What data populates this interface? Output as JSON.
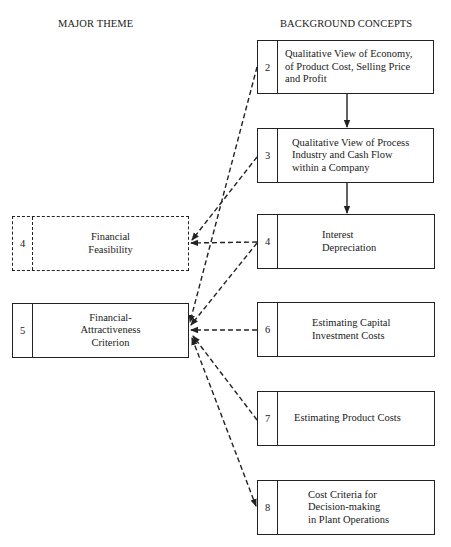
{
  "headers": {
    "left": "MAJOR THEME",
    "right": "BACKGROUND CONCEPTS"
  },
  "major_theme": [
    {
      "num": "4",
      "label": "Financial Feasibility",
      "lines": [
        "Financial",
        "Feasibility"
      ],
      "style": "dashed"
    },
    {
      "num": "5",
      "label": "Financial-Attractiveness Criterion",
      "lines": [
        "Financial-",
        "Attractiveness",
        "Criterion"
      ],
      "style": "solid"
    }
  ],
  "background_concepts": [
    {
      "num": "2",
      "lines": [
        "Qualitative View of Economy,",
        "of Product Cost, Selling Price",
        "and Profit"
      ]
    },
    {
      "num": "3",
      "lines": [
        "Qualitative View of Process",
        "Industry and Cash Flow",
        "within a Company"
      ]
    },
    {
      "num": "4",
      "lines": [
        "Interest",
        "Depreciation"
      ]
    },
    {
      "num": "6",
      "lines": [
        "Estimating Capital",
        "Investment Costs"
      ]
    },
    {
      "num": "7",
      "lines": [
        "Estimating Product Costs"
      ]
    },
    {
      "num": "8",
      "lines": [
        "Cost Criteria for",
        "Decision-making",
        "in Plant Operations"
      ]
    }
  ],
  "connections": [
    {
      "from": "2",
      "to": "3",
      "type": "solid-arrow"
    },
    {
      "from": "3",
      "to": "4",
      "type": "solid-arrow"
    },
    {
      "from": "2",
      "to": "5",
      "type": "dashed-arrow"
    },
    {
      "from": "3",
      "to": "Financial Feasibility",
      "type": "dashed-arrow"
    },
    {
      "from": "4",
      "to": "Financial Feasibility",
      "type": "dashed-arrow"
    },
    {
      "from": "4",
      "to": "5",
      "type": "dashed-arrow"
    },
    {
      "from": "6",
      "to": "5",
      "type": "dashed-arrow"
    },
    {
      "from": "7",
      "to": "5",
      "type": "dashed-arrow"
    },
    {
      "from": "8",
      "to": "5",
      "type": "dashed-bidirectional-arrow"
    }
  ]
}
